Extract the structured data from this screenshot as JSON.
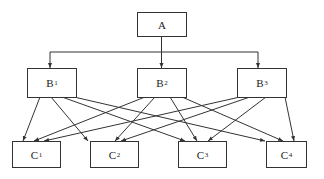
{
  "diagram": {
    "type": "hierarchy",
    "levels": [
      {
        "level": 1,
        "nodes": [
          {
            "id": "A",
            "base": "A",
            "sub": ""
          }
        ]
      },
      {
        "level": 2,
        "nodes": [
          {
            "id": "B1",
            "base": "B",
            "sub": "1"
          },
          {
            "id": "B2",
            "base": "B",
            "sub": "2"
          },
          {
            "id": "B3",
            "base": "B",
            "sub": "3"
          }
        ]
      },
      {
        "level": 3,
        "nodes": [
          {
            "id": "C1",
            "base": "C",
            "sub": "1"
          },
          {
            "id": "C2",
            "base": "C",
            "sub": "2"
          },
          {
            "id": "C3",
            "base": "C",
            "sub": "3"
          },
          {
            "id": "C4",
            "base": "C",
            "sub": "4"
          }
        ]
      }
    ],
    "edges": [
      [
        "A",
        "B1"
      ],
      [
        "A",
        "B2"
      ],
      [
        "A",
        "B3"
      ],
      [
        "B1",
        "C1"
      ],
      [
        "B1",
        "C2"
      ],
      [
        "B1",
        "C3"
      ],
      [
        "B1",
        "C4"
      ],
      [
        "B2",
        "C1"
      ],
      [
        "B2",
        "C2"
      ],
      [
        "B2",
        "C3"
      ],
      [
        "B2",
        "C4"
      ],
      [
        "B3",
        "C1"
      ],
      [
        "B3",
        "C2"
      ],
      [
        "B3",
        "C3"
      ],
      [
        "B3",
        "C4"
      ]
    ],
    "colors": {
      "line": "#333333",
      "box_border": "#333333",
      "background": "#ffffff",
      "text": "#222222"
    }
  },
  "nodes": {
    "A": {
      "base": "A",
      "sub": ""
    },
    "B1": {
      "base": "B",
      "sub": "1"
    },
    "B2": {
      "base": "B",
      "sub": "2"
    },
    "B3": {
      "base": "B",
      "sub": "3"
    },
    "C1": {
      "base": "C",
      "sub": "1"
    },
    "C2": {
      "base": "C",
      "sub": "2"
    },
    "C3": {
      "base": "C",
      "sub": "3"
    },
    "C4": {
      "base": "C",
      "sub": "4"
    }
  }
}
